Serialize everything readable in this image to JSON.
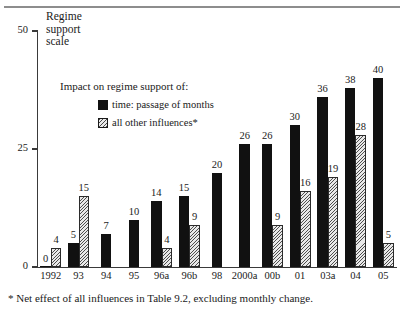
{
  "figure": {
    "y_axis_title": "Regime\nsupport\nscale",
    "footnote": "* Net effect of all influences in Table 9.2, excluding monthly change."
  },
  "legend": {
    "title": "Impact on regime support of:",
    "items": [
      {
        "label": "time: passage of months",
        "swatch": "solid-square-icon",
        "color": "#111111"
      },
      {
        "label": "all other influences*",
        "swatch": "hatched-square-icon",
        "color": "#e9e9e9"
      }
    ]
  },
  "chart_data": {
    "type": "bar",
    "title": "Regime support scale",
    "xlabel": "",
    "ylabel": "Regime support scale",
    "ylim": [
      0,
      50
    ],
    "yticks": [
      0,
      25,
      50
    ],
    "ytick_labels": [
      "0",
      "25",
      "50"
    ],
    "grid": false,
    "legend_position": "inside-upper-left",
    "categories": [
      "1992",
      "93",
      "94",
      "95",
      "96a",
      "96b",
      "98",
      "2000a",
      "00b",
      "01",
      "03a",
      "04",
      "05"
    ],
    "series": [
      {
        "name": "time: passage of months",
        "values": [
          0,
          5,
          7,
          10,
          14,
          15,
          20,
          26,
          26,
          30,
          36,
          38,
          40
        ]
      },
      {
        "name": "all other influences*",
        "values": [
          4,
          15,
          null,
          null,
          4,
          9,
          null,
          null,
          9,
          16,
          19,
          28,
          5
        ]
      }
    ]
  }
}
